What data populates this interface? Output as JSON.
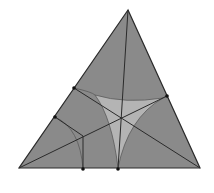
{
  "diagram": {
    "type": "geometry",
    "colors": {
      "background": "#ffffff",
      "triangle_fill": "#8a8a8a",
      "inner_region_fill": "#b4b4b4",
      "stroke": "#2a2a2a",
      "arc_stroke": "#5a5a5a",
      "point": "#111111"
    },
    "vertices": {
      "A": [
        128,
        10
      ],
      "B": [
        19,
        168
      ],
      "C": [
        200,
        168
      ]
    },
    "cevians": [
      {
        "from": "A",
        "to": [
          118,
          169
        ]
      },
      {
        "from": "B",
        "to": [
          167,
          96
        ]
      },
      {
        "from": "C",
        "to": [
          74,
          88
        ]
      }
    ],
    "concurrency_point": [
      118,
      116
    ],
    "marked_points": [
      [
        74,
        88
      ],
      [
        55,
        117
      ],
      [
        167,
        96
      ],
      [
        83,
        169
      ],
      [
        118,
        169
      ]
    ],
    "inner_curvilinear_triangle": {
      "cusps": [
        [
          95,
          95
        ],
        [
          163,
          98
        ],
        [
          118,
          168
        ]
      ]
    },
    "extra_segments": [
      {
        "points": [
          [
            55,
            117
          ],
          [
            83,
            136
          ],
          [
            83,
            169
          ]
        ]
      }
    ]
  }
}
